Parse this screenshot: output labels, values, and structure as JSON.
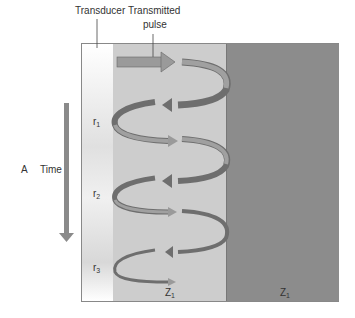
{
  "labels": {
    "transducer": "Transducer",
    "transmitted_line1": "Transmitted",
    "transmitted_line2": "pulse",
    "panel": "A",
    "time": "Time",
    "r1": "r",
    "r1_sub": "1",
    "r2": "r",
    "r2_sub": "2",
    "r3": "r",
    "r3_sub": "3",
    "medium1": "Z",
    "medium1_sub": "1",
    "medium2": "Z",
    "medium2_sub": "1"
  },
  "colors": {
    "transducer": "#f0f0f0",
    "medium1": "#cdcdcd",
    "medium2": "#8c8c8c",
    "arrow_light": "#9a9a9a",
    "arrow_dark": "#6e6e6e",
    "time_arrow": "#8a8a8a"
  }
}
